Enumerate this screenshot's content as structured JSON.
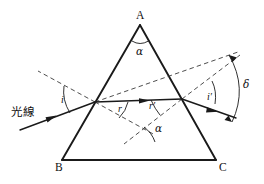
{
  "figure": {
    "type": "optics-ray-diagram",
    "background_color": "#ffffff",
    "line_color": "#1a1a1a"
  },
  "vertices": {
    "apex_label": "A",
    "bottom_left_label": "B",
    "bottom_right_label": "C"
  },
  "labels": {
    "incident_ray": "光線",
    "apex_angle": "α",
    "incidence_angle": "i",
    "refraction_angle": "r",
    "internal_exit_angle": "r′",
    "emergence_angle": "i′",
    "normals_angle": "α",
    "deviation_angle": "δ"
  },
  "geometry": {
    "triangle": {
      "apex": [
        140,
        25
      ],
      "bottom_left": [
        62,
        160
      ],
      "bottom_right": [
        216,
        160
      ]
    },
    "entry_point": [
      95,
      102
    ],
    "exit_point": [
      182,
      99
    ],
    "incident_ray_start": [
      22,
      128
    ],
    "emergent_ray_end": [
      232,
      117
    ],
    "normal_entry_outer": [
      40,
      72
    ],
    "normal_entry_inner": [
      152,
      148
    ],
    "normal_exit_outer": [
      238,
      55
    ],
    "normal_exit_inner": [
      122,
      148
    ],
    "incident_extension_end": [
      236,
      52
    ]
  }
}
